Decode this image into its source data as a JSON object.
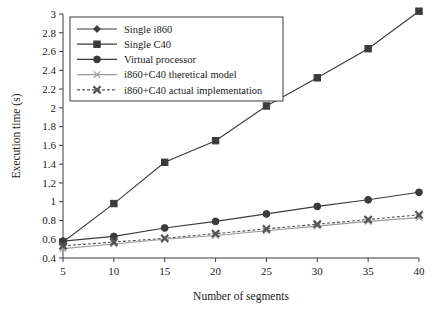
{
  "chart_data": {
    "type": "line",
    "title": "",
    "xlabel": "Number of segments",
    "ylabel": "Execution time (s)",
    "x": [
      5,
      10,
      15,
      20,
      25,
      30,
      35,
      40
    ],
    "xticklabels": [
      "5",
      "10",
      "15",
      "20",
      "25",
      "30",
      "35",
      "40"
    ],
    "xlim": [
      5,
      40
    ],
    "ylim": [
      0.4,
      3
    ],
    "yticks": [
      0.4,
      0.6,
      0.8,
      1,
      1.2,
      1.4,
      1.6,
      1.8,
      2,
      2.2,
      2.4,
      2.6,
      2.8,
      3
    ],
    "yticklabels": [
      "0.4",
      "0.6",
      "0.8",
      "1",
      "1.2",
      "1.4",
      "1.6",
      "1.8",
      "2",
      "2.2",
      "2.4",
      "2.6",
      "2.8",
      "3"
    ],
    "grid": false,
    "legend_position": "top-left",
    "series": [
      {
        "name": "Single i860",
        "marker": "diamond",
        "color": "#3b3b3b",
        "linestyle": "solid",
        "values": [
          0.58,
          null,
          null,
          null,
          null,
          null,
          null,
          null
        ]
      },
      {
        "name": "Single C40",
        "marker": "square",
        "color": "#3b3b3b",
        "linestyle": "solid",
        "values": [
          0.57,
          0.98,
          1.42,
          1.65,
          2.02,
          2.32,
          2.63,
          3.03
        ]
      },
      {
        "name": "Virtual processor",
        "marker": "circle",
        "color": "#3b3b3b",
        "linestyle": "solid",
        "values": [
          0.58,
          0.63,
          0.72,
          0.79,
          0.87,
          0.95,
          1.02,
          1.1
        ]
      },
      {
        "name": "i860+C40 theretical model",
        "marker": "x-thin",
        "color": "#9a9a9a",
        "linestyle": "solid",
        "values": [
          0.5,
          0.55,
          0.6,
          0.64,
          0.69,
          0.74,
          0.79,
          0.83
        ]
      },
      {
        "name": "i860+C40 actual implementation",
        "marker": "x-bold",
        "color": "#555555",
        "linestyle": "dashed",
        "values": [
          0.53,
          0.57,
          0.61,
          0.66,
          0.71,
          0.76,
          0.81,
          0.86
        ]
      }
    ]
  }
}
